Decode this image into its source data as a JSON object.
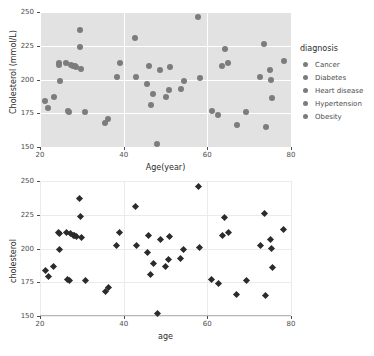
{
  "chart_data": [
    {
      "id": "top",
      "type": "scatter",
      "title": "",
      "xlabel": "Age(year)",
      "ylabel": "Cholesterol (mmol/L)",
      "xlim": [
        20,
        80
      ],
      "ylim": [
        150,
        250
      ],
      "xticks": [
        20,
        40,
        60,
        80
      ],
      "yticks": [
        150,
        175,
        200,
        225,
        250
      ],
      "grid": true,
      "theme": "grey-panel",
      "marker": "circle",
      "marker_color": "#7c7c7c",
      "panel_color": "#e2e2e2",
      "legend": {
        "position": "right",
        "title": "diagnosis",
        "entries": [
          "Cancer",
          "Diabetes",
          "Heart disease",
          "Hypertension",
          "Obesity"
        ]
      },
      "points": [
        {
          "x": 21.3,
          "y": 184
        },
        {
          "x": 22.0,
          "y": 179
        },
        {
          "x": 23.3,
          "y": 187
        },
        {
          "x": 24.5,
          "y": 212
        },
        {
          "x": 24.6,
          "y": 211
        },
        {
          "x": 24.7,
          "y": 199
        },
        {
          "x": 26.3,
          "y": 212
        },
        {
          "x": 26.6,
          "y": 177
        },
        {
          "x": 27.0,
          "y": 176
        },
        {
          "x": 27.3,
          "y": 211
        },
        {
          "x": 27.9,
          "y": 210
        },
        {
          "x": 28.3,
          "y": 210
        },
        {
          "x": 28.7,
          "y": 209
        },
        {
          "x": 29.5,
          "y": 237
        },
        {
          "x": 29.6,
          "y": 224
        },
        {
          "x": 29.8,
          "y": 208
        },
        {
          "x": 30.8,
          "y": 176
        },
        {
          "x": 35.6,
          "y": 168
        },
        {
          "x": 36.3,
          "y": 171
        },
        {
          "x": 38.3,
          "y": 202
        },
        {
          "x": 39.0,
          "y": 212
        },
        {
          "x": 42.8,
          "y": 231
        },
        {
          "x": 43.0,
          "y": 202
        },
        {
          "x": 45.6,
          "y": 197
        },
        {
          "x": 46.0,
          "y": 210
        },
        {
          "x": 46.5,
          "y": 181
        },
        {
          "x": 47.0,
          "y": 189
        },
        {
          "x": 48.0,
          "y": 152
        },
        {
          "x": 48.7,
          "y": 207
        },
        {
          "x": 50.0,
          "y": 187
        },
        {
          "x": 50.8,
          "y": 192
        },
        {
          "x": 51.0,
          "y": 209
        },
        {
          "x": 53.6,
          "y": 193
        },
        {
          "x": 54.3,
          "y": 199
        },
        {
          "x": 57.8,
          "y": 246
        },
        {
          "x": 58.2,
          "y": 201
        },
        {
          "x": 61.0,
          "y": 177
        },
        {
          "x": 62.6,
          "y": 174
        },
        {
          "x": 63.5,
          "y": 210
        },
        {
          "x": 64.2,
          "y": 223
        },
        {
          "x": 65.0,
          "y": 212
        },
        {
          "x": 67.0,
          "y": 166
        },
        {
          "x": 69.3,
          "y": 176
        },
        {
          "x": 72.6,
          "y": 202
        },
        {
          "x": 73.6,
          "y": 226
        },
        {
          "x": 74.0,
          "y": 165
        },
        {
          "x": 75.0,
          "y": 207
        },
        {
          "x": 75.3,
          "y": 200
        },
        {
          "x": 75.5,
          "y": 186
        },
        {
          "x": 78.3,
          "y": 214
        }
      ]
    },
    {
      "id": "bottom",
      "type": "scatter",
      "title": "",
      "xlabel": "age",
      "ylabel": "cholesterol",
      "xlim": [
        20,
        80
      ],
      "ylim": [
        150,
        250
      ],
      "xticks": [
        20,
        40,
        60,
        80
      ],
      "yticks": [
        150,
        175,
        200,
        225,
        250
      ],
      "grid": true,
      "theme": "white-panel",
      "marker": "diamond",
      "marker_color": "#2b2b2b",
      "panel_color": "#ffffff",
      "legend": null,
      "points": [
        {
          "x": 21.3,
          "y": 184
        },
        {
          "x": 22.0,
          "y": 179
        },
        {
          "x": 23.3,
          "y": 187
        },
        {
          "x": 24.5,
          "y": 212
        },
        {
          "x": 24.6,
          "y": 211
        },
        {
          "x": 24.7,
          "y": 199
        },
        {
          "x": 26.3,
          "y": 212
        },
        {
          "x": 26.6,
          "y": 177
        },
        {
          "x": 27.0,
          "y": 176
        },
        {
          "x": 27.3,
          "y": 211
        },
        {
          "x": 27.9,
          "y": 210
        },
        {
          "x": 28.3,
          "y": 210
        },
        {
          "x": 28.7,
          "y": 209
        },
        {
          "x": 29.5,
          "y": 237
        },
        {
          "x": 29.6,
          "y": 224
        },
        {
          "x": 29.8,
          "y": 208
        },
        {
          "x": 30.8,
          "y": 176
        },
        {
          "x": 35.6,
          "y": 168
        },
        {
          "x": 36.3,
          "y": 171
        },
        {
          "x": 38.3,
          "y": 202
        },
        {
          "x": 39.0,
          "y": 212
        },
        {
          "x": 42.8,
          "y": 231
        },
        {
          "x": 43.0,
          "y": 202
        },
        {
          "x": 45.6,
          "y": 197
        },
        {
          "x": 46.0,
          "y": 210
        },
        {
          "x": 46.5,
          "y": 181
        },
        {
          "x": 47.0,
          "y": 189
        },
        {
          "x": 48.0,
          "y": 152
        },
        {
          "x": 48.7,
          "y": 207
        },
        {
          "x": 50.0,
          "y": 187
        },
        {
          "x": 50.8,
          "y": 192
        },
        {
          "x": 51.0,
          "y": 209
        },
        {
          "x": 53.6,
          "y": 193
        },
        {
          "x": 54.3,
          "y": 199
        },
        {
          "x": 57.8,
          "y": 246
        },
        {
          "x": 58.2,
          "y": 201
        },
        {
          "x": 61.0,
          "y": 177
        },
        {
          "x": 62.6,
          "y": 174
        },
        {
          "x": 63.5,
          "y": 210
        },
        {
          "x": 64.2,
          "y": 223
        },
        {
          "x": 65.0,
          "y": 212
        },
        {
          "x": 67.0,
          "y": 166
        },
        {
          "x": 69.3,
          "y": 176
        },
        {
          "x": 72.6,
          "y": 202
        },
        {
          "x": 73.6,
          "y": 226
        },
        {
          "x": 74.0,
          "y": 165
        },
        {
          "x": 75.0,
          "y": 207
        },
        {
          "x": 75.3,
          "y": 200
        },
        {
          "x": 75.5,
          "y": 186
        },
        {
          "x": 78.3,
          "y": 214
        }
      ]
    }
  ]
}
